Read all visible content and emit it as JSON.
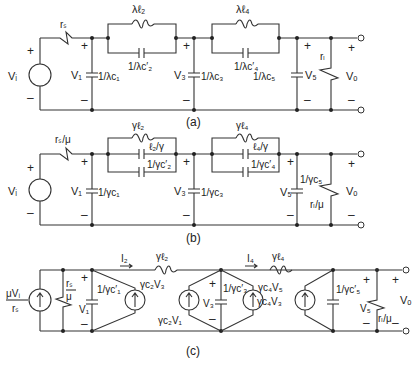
{
  "figure": {
    "a": {
      "caption": "(a)",
      "source": "Vᵢ",
      "rs": "rₛ",
      "v1": "V₁",
      "c1": "1/λc₁",
      "l2": "λℓ₂",
      "c2": "1/λc′₂",
      "v3": "V₃",
      "c3": "1/λc₃",
      "l4": "λℓ₄",
      "c4": "1/λc′₄",
      "c5": "1/λc₅",
      "v5": "V₅",
      "rl": "rₗ",
      "vo": "Vₒ"
    },
    "b": {
      "caption": "(b)",
      "source": "Vᵢ",
      "rs": "rₛ/μ",
      "v1": "V₁",
      "c1": "1/γc₁",
      "l2": "γℓ₂",
      "l2c": "ℓ₂/γ",
      "c2": "1/γc′₂",
      "v3": "V₃",
      "c3": "1/γc₃",
      "l4": "γℓ₄",
      "l4c": "ℓ₄/γ",
      "c4": "1/γc′₄",
      "c5": "1/γc₅",
      "v5": "V₅",
      "rl": "rₗ/μ",
      "vo": "Vₒ"
    },
    "c": {
      "caption": "(c)",
      "src_num": "μVᵢ",
      "src_den": "rₛ",
      "rs_num": "rₛ",
      "rs_den": "μ",
      "v1": "V₁",
      "c1": "1/γc′₁",
      "i2": "I₂",
      "l2": "γℓ₂",
      "g23": "γc₂V₃",
      "g21": "γc₂V₁",
      "v3": "V₃",
      "c3": "1/γc′₃",
      "i4": "I₄",
      "l4": "γℓ₄",
      "g45": "γc₄V₅",
      "g43": "γc₄V₃",
      "c5": "1/γc′₅",
      "v5": "V₅",
      "rl": "rₗ/μ",
      "vo": "Vₒ"
    },
    "plus": "+",
    "minus": "–"
  }
}
